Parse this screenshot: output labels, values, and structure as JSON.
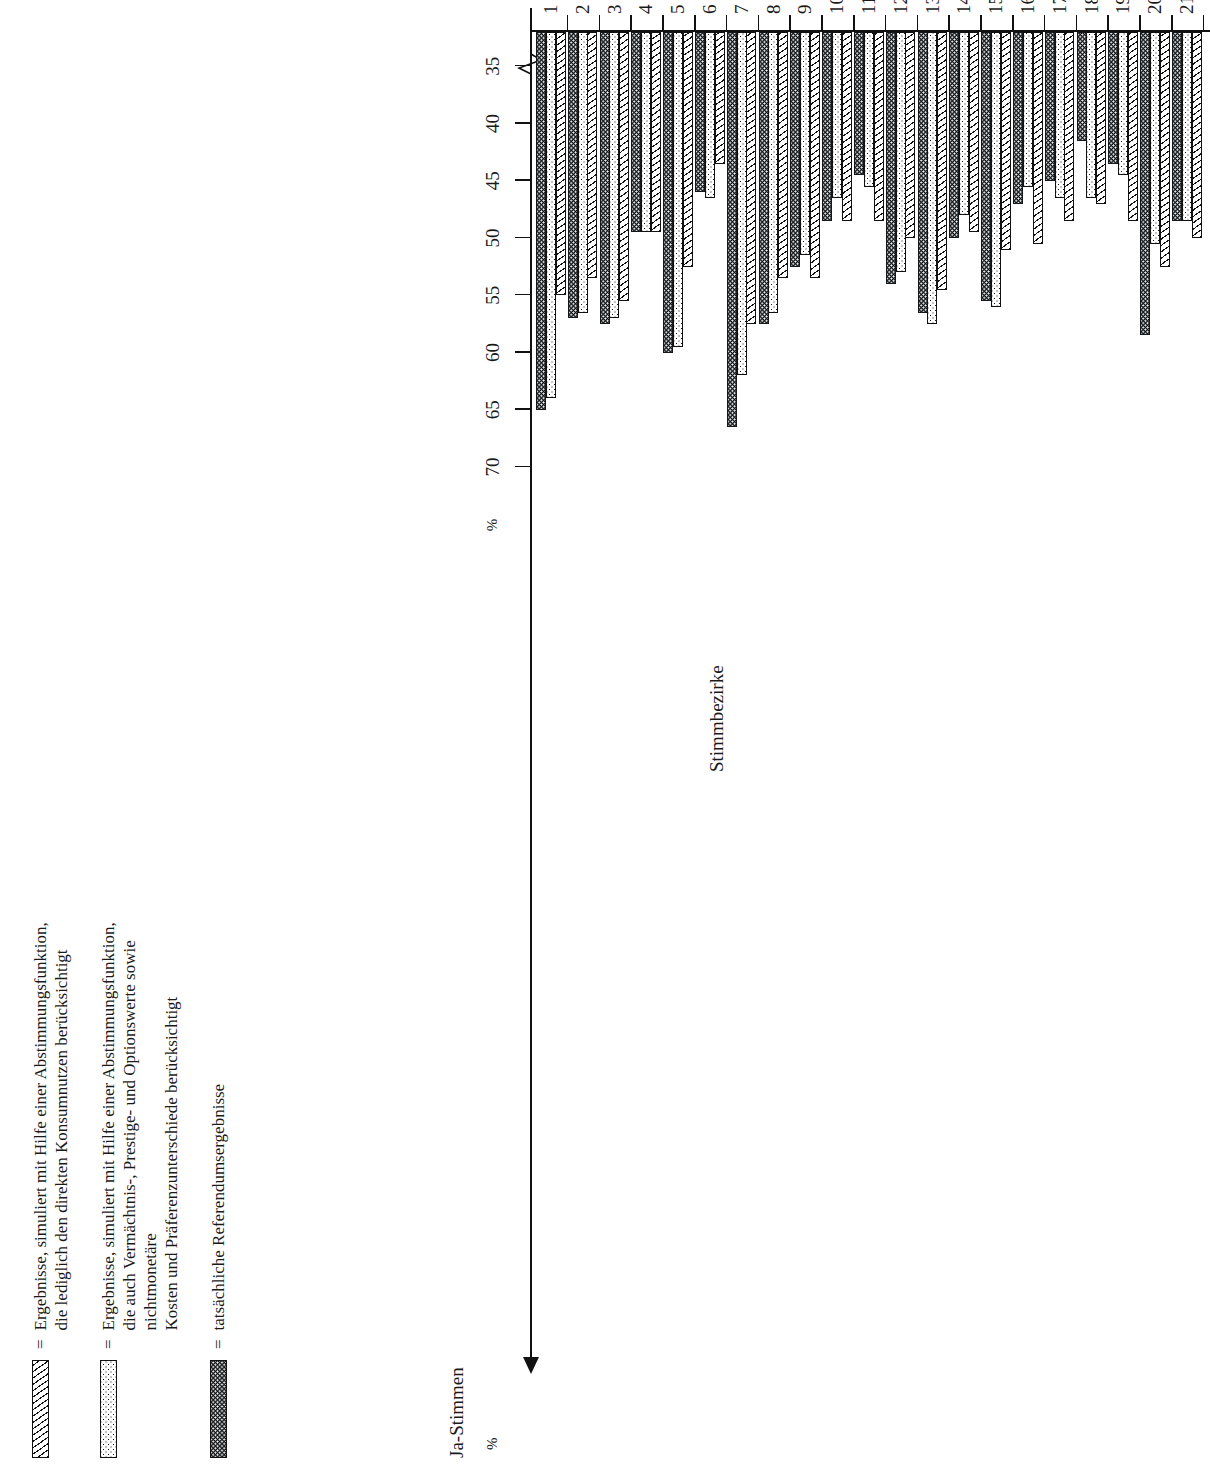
{
  "legend": {
    "items": [
      {
        "swatch": "hatch",
        "equals": "=",
        "text": "Ergebnisse, simuliert mit Hilfe einer Abstimmungsfunktion,\ndie lediglich den direkten Konsumnutzen berücksichtigt"
      },
      {
        "swatch": "dots",
        "equals": "=",
        "text": "Ergebnisse, simuliert mit Hilfe einer Abstimmungsfunktion,\ndie auch Vermächtnis-, Prestige- und Optionswerte sowie nichtmonetäre\nKosten und Präferenzunterschiede berücksichtigt"
      },
      {
        "swatch": "dark",
        "equals": "=",
        "text": "tatsächliche Referendumsergebnisse"
      }
    ]
  },
  "axes": {
    "value_axis_title": "Ja-Stimmen",
    "value_axis_unit": "%",
    "category_axis_title": "Stimmbezirke"
  },
  "chart_data": {
    "type": "bar",
    "orientation": "horizontal",
    "title": "",
    "xlabel": "Ja-Stimmen",
    "ylabel": "Stimmbezirke",
    "unit": "%",
    "value_axis_ticks": [
      70,
      65,
      60,
      55,
      50,
      45,
      40,
      35
    ],
    "value_axis_tick_labels": [
      "70",
      "65",
      "60",
      "55",
      "50",
      "45",
      "40",
      "35"
    ],
    "value_axis_direction": "decreasing-left-to-right",
    "value_axis_has_scale_break": true,
    "xlim": [
      32,
      72
    ],
    "grid": false,
    "legend_position": "top-left",
    "categories": [
      "1",
      "2",
      "3",
      "4",
      "5",
      "6",
      "7",
      "8",
      "9",
      "10",
      "11",
      "12",
      "13",
      "14",
      "15",
      "16",
      "17",
      "18",
      "19",
      "20",
      "21"
    ],
    "series": [
      {
        "name": "Ergebnisse, simuliert mit Hilfe einer Abstimmungsfunktion, die lediglich den direkten Konsumnutzen berücksichtigt",
        "pattern": "hatch",
        "values": [
          55.0,
          53.5,
          55.5,
          49.5,
          52.5,
          43.5,
          57.5,
          53.5,
          53.5,
          48.5,
          48.5,
          50.0,
          54.5,
          49.5,
          51.0,
          50.5,
          48.5,
          47.0,
          48.5,
          52.5,
          50.0
        ]
      },
      {
        "name": "Ergebnisse, simuliert mit Hilfe einer Abstimmungsfunktion, die auch Vermächtnis-, Prestige- und Optionswerte sowie nichtmonetäre Kosten und Präferenzunterschiede berücksichtigt",
        "pattern": "dots",
        "values": [
          64.0,
          56.5,
          57.0,
          49.5,
          59.5,
          46.5,
          62.0,
          56.5,
          51.5,
          46.5,
          45.5,
          53.0,
          57.5,
          48.0,
          56.0,
          45.5,
          46.5,
          46.5,
          44.5,
          50.5,
          48.5
        ]
      },
      {
        "name": "tatsächliche Referendumsergebnisse",
        "pattern": "dark",
        "values": [
          65.0,
          57.0,
          57.5,
          49.5,
          60.0,
          46.0,
          66.5,
          57.5,
          52.5,
          48.5,
          44.5,
          54.0,
          56.5,
          50.0,
          55.5,
          47.0,
          45.0,
          41.5,
          43.5,
          58.5,
          48.5
        ]
      }
    ]
  }
}
